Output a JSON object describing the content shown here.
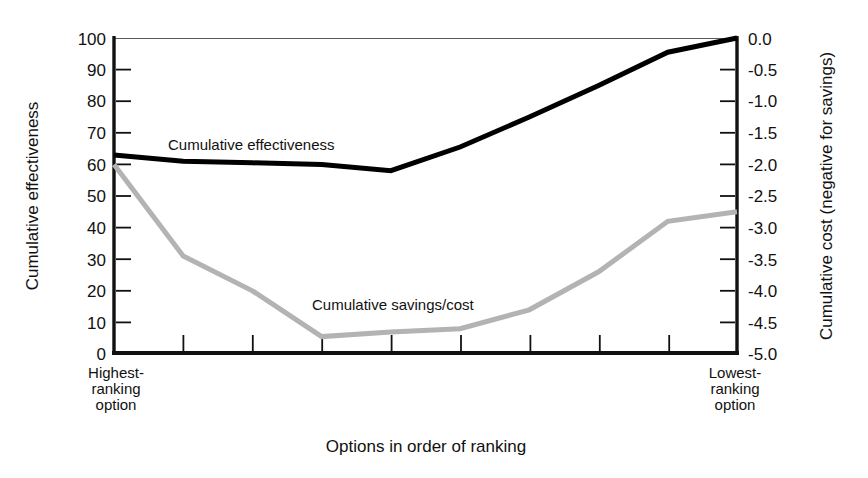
{
  "chart_data": {
    "type": "line",
    "title": "",
    "xlabel": "Options in order of ranking",
    "ylabel": "Cumulative effectiveness",
    "y2label": "Cumulative cost (negative for savings)",
    "grid": false,
    "legend_position": "inline-annotation",
    "x": [
      0,
      1,
      2,
      3,
      4,
      5,
      6,
      7,
      8,
      9
    ],
    "xlim": [
      0,
      9
    ],
    "x_category_labels": [
      "Highest-ranking option",
      "Lowest-ranking option"
    ],
    "x_tick_count": 10,
    "ylim": [
      0,
      100
    ],
    "yticks": [
      0,
      10,
      20,
      30,
      40,
      50,
      60,
      70,
      80,
      90,
      100
    ],
    "ytick_labels": [
      "0",
      "10",
      "20",
      "30",
      "40",
      "50",
      "60",
      "70",
      "80",
      "90",
      "100"
    ],
    "y2lim": [
      -5.0,
      0.0
    ],
    "y2ticks": [
      -5.0,
      -4.5,
      -4.0,
      -3.5,
      -3.0,
      -2.5,
      -2.0,
      -1.5,
      -1.0,
      -0.5,
      0.0
    ],
    "y2tick_labels": [
      "-5.0",
      "-4.5",
      "-4.0",
      "-3.5",
      "-3.0",
      "-2.5",
      "-2.0",
      "-1.5",
      "-1.0",
      "-0.5",
      "0.0"
    ],
    "series": [
      {
        "name": "Cumulative effectiveness",
        "axis": "left",
        "color": "#000000",
        "values": [
          63,
          61,
          60.5,
          60,
          58,
          65.5,
          75,
          85,
          95.5,
          100
        ]
      },
      {
        "name": "Cumulative savings/cost",
        "axis": "left",
        "color": "#b3b3b3",
        "values": [
          60,
          31,
          20,
          5.5,
          7,
          8,
          14,
          26,
          42,
          45
        ]
      }
    ],
    "annotations": [
      {
        "text": "Cumulative effectiveness",
        "x_px": 168,
        "y_px": 145
      },
      {
        "text": "Cumulative savings/cost",
        "x_px": 312,
        "y_px": 305
      }
    ]
  },
  "axes": {
    "left_title": "Cumulative effectiveness",
    "right_title": "Cumulative cost (negative for savings)",
    "bottom_title": "Options in order of ranking",
    "left_end_label_lines": [
      "Highest-",
      "ranking",
      "option"
    ],
    "right_end_label_lines": [
      "Lowest-",
      "ranking",
      "option"
    ]
  },
  "colors": {
    "effectiveness_line": "#000000",
    "savings_line": "#b3b3b3",
    "axis": "#111111",
    "background": "#ffffff"
  }
}
